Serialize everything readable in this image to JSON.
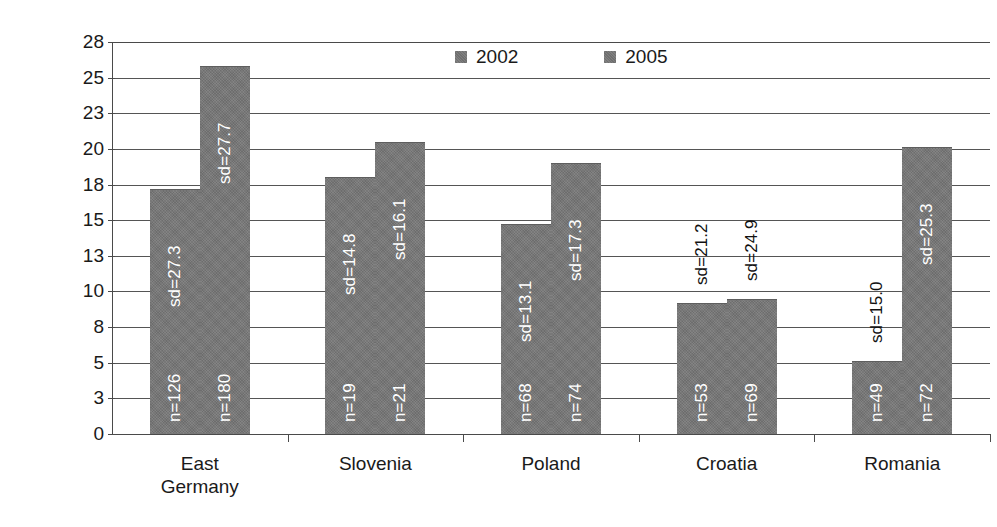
{
  "chart_data": {
    "type": "bar",
    "title": "",
    "subtitle": "",
    "xlabel": "",
    "ylabel": "",
    "ylim": [
      0,
      27.5
    ],
    "grid": true,
    "legend_position": "top-center",
    "categories": [
      "East\nGermany",
      "Slovenia",
      "Poland",
      "Croatia",
      "Romania"
    ],
    "y_ticks": [
      0,
      3,
      5,
      8,
      10,
      13,
      15,
      18,
      20,
      23,
      25,
      28
    ],
    "y_tick_positions": [
      0,
      2.5,
      5,
      7.5,
      10,
      12.5,
      15,
      17.5,
      20,
      22.5,
      25,
      27.5
    ],
    "series": [
      {
        "name": "2002",
        "color": "#757575",
        "values": [
          17.2,
          18.0,
          14.7,
          9.2,
          5.1
        ],
        "sd": [
          "sd=27.3",
          "sd=14.8",
          "sd=13.1",
          "sd=21.2",
          "sd=15.0"
        ],
        "n": [
          "n=126",
          "n=19",
          "n=68",
          "n=53",
          "n=49"
        ]
      },
      {
        "name": "2005",
        "color": "#757575",
        "values": [
          25.8,
          20.5,
          19.0,
          9.5,
          20.1
        ],
        "sd": [
          "sd=27.7",
          "sd=16.1",
          "sd=17.3",
          "sd=24.9",
          "sd=25.3"
        ],
        "n": [
          "n=180",
          "n=21",
          "n=74",
          "n=69",
          "n=72"
        ]
      }
    ]
  },
  "legend": {
    "items": [
      {
        "label": "2002",
        "color": "#757575"
      },
      {
        "label": "2005",
        "color": "#757575"
      }
    ]
  },
  "axis": {
    "y_labels": [
      "28",
      "25",
      "23",
      "20",
      "18",
      "15",
      "13",
      "10",
      "8",
      "5",
      "3",
      "0"
    ],
    "x_labels": [
      "East\nGermany",
      "Slovenia",
      "Poland",
      "Croatia",
      "Romania"
    ]
  },
  "bar_annotations": [
    {
      "group": "East Germany",
      "year": "2002",
      "sd": "sd=27.3",
      "n": "n=126"
    },
    {
      "group": "East Germany",
      "year": "2005",
      "sd": "sd=27.7",
      "n": "n=180"
    },
    {
      "group": "Slovenia",
      "year": "2002",
      "sd": "sd=14.8",
      "n": "n=19"
    },
    {
      "group": "Slovenia",
      "year": "2005",
      "sd": "sd=16.1",
      "n": "n=21"
    },
    {
      "group": "Poland",
      "year": "2002",
      "sd": "sd=13.1",
      "n": "n=68"
    },
    {
      "group": "Poland",
      "year": "2005",
      "sd": "sd=17.3",
      "n": "n=74"
    },
    {
      "group": "Croatia",
      "year": "2002",
      "sd": "sd=21.2",
      "n": "n=53"
    },
    {
      "group": "Croatia",
      "year": "2005",
      "sd": "sd=24.9",
      "n": "n=69"
    },
    {
      "group": "Romania",
      "year": "2002",
      "sd": "sd=15.0",
      "n": "n=49"
    },
    {
      "group": "Romania",
      "year": "2005",
      "sd": "sd=25.3",
      "n": "n=72"
    }
  ]
}
